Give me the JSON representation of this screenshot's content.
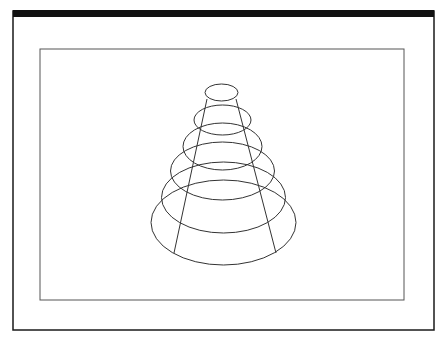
{
  "figure": {
    "colors": {
      "background": "#ffffff",
      "frame": "#1a1a1a",
      "top_bar": "#111111",
      "inner_frame": "#555555",
      "stroke": "#333333"
    },
    "outer_frame": {
      "x": 13,
      "y": 11,
      "width": 421,
      "height": 319
    },
    "top_bar": {
      "x": 13,
      "y": 10,
      "width": 421,
      "height": 7
    },
    "inner_frame": {
      "x": 40,
      "y": 49,
      "width": 364,
      "height": 251
    },
    "ellipses": [
      {
        "cx": 221.5,
        "cy": 92.5,
        "rx": 16.5,
        "ry": 8.5
      },
      {
        "cx": 222.5,
        "cy": 120,
        "rx": 28.5,
        "ry": 15
      },
      {
        "cx": 222.5,
        "cy": 146.5,
        "rx": 39.5,
        "ry": 23.5
      },
      {
        "cx": 222.5,
        "cy": 171,
        "rx": 52,
        "ry": 29
      },
      {
        "cx": 223.5,
        "cy": 197.5,
        "rx": 62,
        "ry": 35.5
      },
      {
        "cx": 223.5,
        "cy": 222.5,
        "rx": 72.5,
        "ry": 42.5
      }
    ],
    "generator_lines": [
      {
        "x1": 207,
        "y1": 99,
        "x2": 174,
        "y2": 253
      },
      {
        "x1": 236,
        "y1": 99,
        "x2": 276,
        "y2": 253
      }
    ]
  }
}
